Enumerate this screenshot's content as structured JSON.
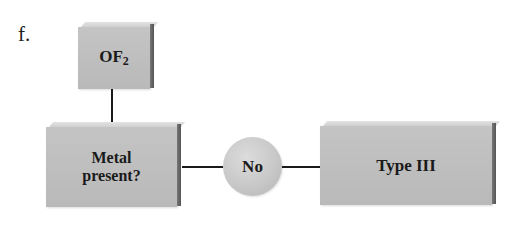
{
  "diagram": {
    "label": "f.",
    "nodes": [
      {
        "id": "compound",
        "shape": "box",
        "text": "OF",
        "subscript": "2"
      },
      {
        "id": "question",
        "shape": "box",
        "line1": "Metal",
        "line2": "present?"
      },
      {
        "id": "answer",
        "shape": "circle",
        "text": "No"
      },
      {
        "id": "result",
        "shape": "box",
        "text": "Type III"
      }
    ],
    "edges": [
      {
        "from": "compound",
        "to": "question"
      },
      {
        "from": "question",
        "to": "answer"
      },
      {
        "from": "answer",
        "to": "result"
      }
    ],
    "colors": {
      "box_fill": "#bdbdbd",
      "box_side": "#666666",
      "line": "#1a1a1a"
    }
  }
}
